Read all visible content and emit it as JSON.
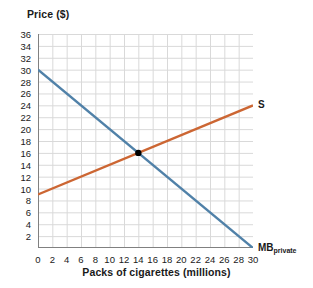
{
  "chart_data": {
    "type": "line",
    "title": "",
    "xlabel": "Packs of cigarettes (millions)",
    "ylabel": "Price ($)",
    "xlim": [
      0,
      30
    ],
    "ylim": [
      0,
      36
    ],
    "xticks": [
      0,
      2,
      4,
      6,
      8,
      10,
      12,
      14,
      16,
      18,
      20,
      22,
      24,
      26,
      28,
      30
    ],
    "yticks": [
      2,
      4,
      6,
      8,
      10,
      12,
      14,
      16,
      18,
      20,
      22,
      24,
      26,
      28,
      30,
      32,
      34,
      36
    ],
    "grid": true,
    "legend_position": "inline-end-of-curve",
    "series": [
      {
        "name": "S",
        "label": "S",
        "label_subscript": "",
        "color": "#cc6633",
        "points": [
          [
            0,
            9
          ],
          [
            30,
            24
          ]
        ]
      },
      {
        "name": "MB_private",
        "label": "MB",
        "label_subscript": "private",
        "color": "#5081a8",
        "points": [
          [
            0,
            30
          ],
          [
            30,
            0
          ]
        ]
      }
    ],
    "annotations": [
      {
        "type": "point",
        "name": "equilibrium-point",
        "x": 14,
        "y": 16,
        "color": "#000000"
      }
    ],
    "colors": {
      "grid": "#d9d9d9",
      "axis": "#808080",
      "text": "#1a1a1a",
      "background": "#ffffff"
    }
  }
}
